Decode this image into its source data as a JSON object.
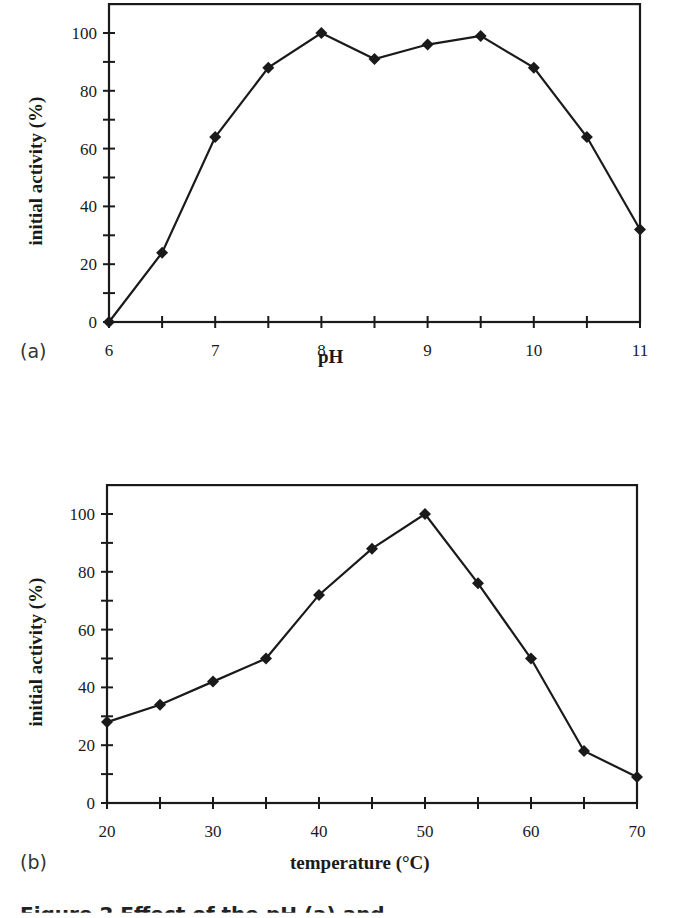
{
  "chart_data": [
    {
      "type": "line",
      "panel": "(a)",
      "title": "",
      "xlabel": "pH",
      "ylabel": "initial activity (%)",
      "x": [
        6,
        6.5,
        7,
        7.5,
        8,
        8.5,
        9,
        9.5,
        10,
        10.5,
        11
      ],
      "series": [
        {
          "name": "initial activity",
          "values": [
            0,
            24,
            64,
            88,
            100,
            91,
            96,
            99,
            88,
            64,
            32
          ]
        }
      ],
      "xlim": [
        6,
        11
      ],
      "ylim": [
        0,
        110
      ],
      "xticks": [
        "6",
        "7",
        "8",
        "9",
        "10",
        "11"
      ],
      "yticks": [
        "0",
        "20",
        "40",
        "60",
        "80",
        "100"
      ],
      "marker": "diamond",
      "grid": false,
      "legend": "none"
    },
    {
      "type": "line",
      "panel": "(b)",
      "title": "",
      "xlabel": "temperature (°C)",
      "ylabel": "initial activity (%)",
      "x": [
        20,
        25,
        30,
        35,
        40,
        45,
        50,
        55,
        60,
        65,
        70
      ],
      "series": [
        {
          "name": "initial activity",
          "values": [
            28,
            34,
            42,
            50,
            72,
            88,
            100,
            76,
            50,
            18,
            9
          ]
        }
      ],
      "xlim": [
        20,
        70
      ],
      "ylim": [
        0,
        110
      ],
      "xticks": [
        "20",
        "30",
        "40",
        "50",
        "60",
        "70"
      ],
      "yticks": [
        "0",
        "20",
        "40",
        "60",
        "80",
        "100"
      ],
      "marker": "diamond",
      "grid": false,
      "legend": "none"
    }
  ],
  "panels": {
    "a": {
      "label": "(a)",
      "xlabel": "pH",
      "ylabel": "initial activity (%)"
    },
    "b": {
      "label": "(b)",
      "xlabel": "temperature (°C)",
      "ylabel": "initial activity (%)"
    }
  },
  "caption": "Figure 2   Effect of the pH (a) and",
  "colors": {
    "line": "#1a1a1a",
    "marker": "#1a1a1a",
    "background": "#ffffff"
  }
}
